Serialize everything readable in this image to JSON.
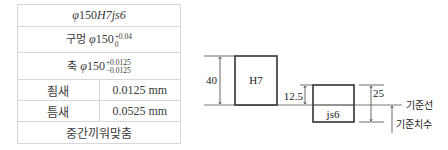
{
  "table": {
    "title": {
      "phi": "φ",
      "size": "150",
      "fit": "H7js6"
    },
    "hole": {
      "label": "구멍",
      "phi": "φ",
      "size": "150",
      "upper": "+0.04",
      "lower": "0"
    },
    "shaft": {
      "label": "축",
      "phi": "φ",
      "size": "150",
      "upper": "+0.0125",
      "lower": "−0.0125"
    },
    "rows": [
      {
        "label": "죔새",
        "value": "0.0125 mm"
      },
      {
        "label": "틈새",
        "value": "0.0525 mm"
      }
    ],
    "result": "중간끼워맞춤"
  },
  "diagram": {
    "hole_label": "H7",
    "shaft_label": "js6",
    "dim_hole": "40",
    "dim_shaft_upper": "12.5",
    "dim_shaft_total": "25",
    "baseline_label": "기준선",
    "basic_size_label": "기준치수",
    "line_color": "#333333"
  }
}
